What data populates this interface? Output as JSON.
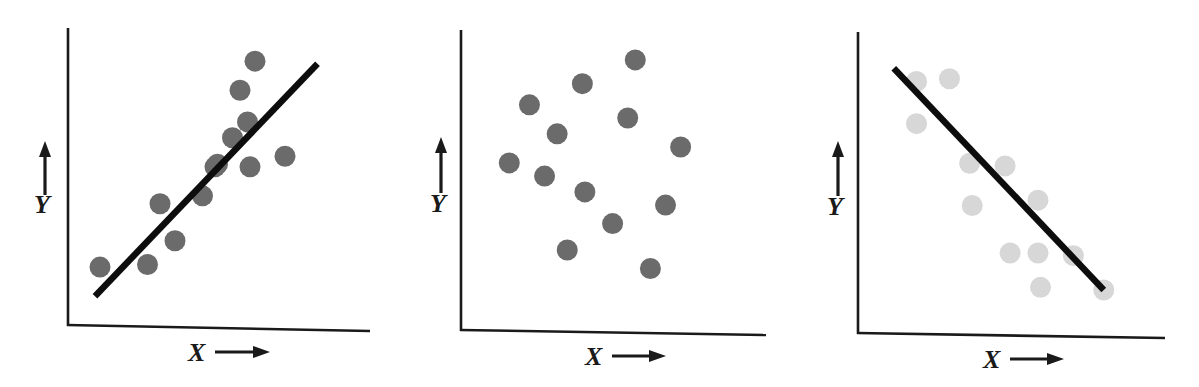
{
  "figure": {
    "background": "#ffffff",
    "width": 1199,
    "height": 387,
    "panel_count": 3
  },
  "style": {
    "axis_color": "#1a1a1a",
    "axis_width": 2.6,
    "trend_line_color": "#0d0d0d",
    "trend_line_width": 6.5,
    "dot_dark": "#6b6b6b",
    "dot_light": "#d7d7d7",
    "dot_radius": 10.5,
    "label_color": "#1a1a1a"
  },
  "chart_data": [
    {
      "type": "scatter",
      "title": "",
      "subtitle": "",
      "relationship": "positive correlation",
      "xlabel": "X",
      "ylabel": "Y",
      "xlabel_arrow": "right-arrow",
      "ylabel_arrow": "up-arrow",
      "grid": false,
      "legend": "none",
      "xlim": [
        0,
        100
      ],
      "ylim": [
        0,
        100
      ],
      "dot_color": "#6b6b6b",
      "has_trend_line": true,
      "trend_line": {
        "x": [
          6,
          95
        ],
        "y": [
          6,
          94
        ]
      },
      "points": [
        {
          "x": 8,
          "y": 17
        },
        {
          "x": 27,
          "y": 18
        },
        {
          "x": 38,
          "y": 27
        },
        {
          "x": 32,
          "y": 41
        },
        {
          "x": 49,
          "y": 44
        },
        {
          "x": 54,
          "y": 55
        },
        {
          "x": 55,
          "y": 56
        },
        {
          "x": 61,
          "y": 66
        },
        {
          "x": 67,
          "y": 72
        },
        {
          "x": 68,
          "y": 55
        },
        {
          "x": 64,
          "y": 84
        },
        {
          "x": 70,
          "y": 95
        },
        {
          "x": 82,
          "y": 59
        }
      ]
    },
    {
      "type": "scatter",
      "title": "",
      "subtitle": "",
      "relationship": "no correlation",
      "xlabel": "X",
      "ylabel": "Y",
      "xlabel_arrow": "right-arrow",
      "ylabel_arrow": "up-arrow",
      "grid": false,
      "legend": "none",
      "xlim": [
        0,
        100
      ],
      "ylim": [
        0,
        100
      ],
      "dot_color": "#6b6b6b",
      "has_trend_line": false,
      "points": [
        {
          "x": 14,
          "y": 58
        },
        {
          "x": 22,
          "y": 80
        },
        {
          "x": 28,
          "y": 53
        },
        {
          "x": 37,
          "y": 25
        },
        {
          "x": 33,
          "y": 69
        },
        {
          "x": 43,
          "y": 88
        },
        {
          "x": 44,
          "y": 47
        },
        {
          "x": 55,
          "y": 35
        },
        {
          "x": 61,
          "y": 75
        },
        {
          "x": 64,
          "y": 97
        },
        {
          "x": 70,
          "y": 18
        },
        {
          "x": 76,
          "y": 42
        },
        {
          "x": 82,
          "y": 64
        }
      ]
    },
    {
      "type": "scatter",
      "title": "",
      "subtitle": "",
      "relationship": "negative correlation",
      "xlabel": "X",
      "ylabel": "Y",
      "xlabel_arrow": "right-arrow",
      "ylabel_arrow": "up-arrow",
      "grid": false,
      "legend": "none",
      "xlim": [
        0,
        100
      ],
      "ylim": [
        0,
        100
      ],
      "dot_color": "#d7d7d7",
      "has_trend_line": true,
      "trend_line": {
        "x": [
          9,
          92
        ],
        "y": [
          95,
          11
        ]
      },
      "points": [
        {
          "x": 18,
          "y": 90
        },
        {
          "x": 31,
          "y": 91
        },
        {
          "x": 18,
          "y": 74
        },
        {
          "x": 39,
          "y": 59
        },
        {
          "x": 53,
          "y": 58
        },
        {
          "x": 40,
          "y": 43
        },
        {
          "x": 66,
          "y": 45
        },
        {
          "x": 55,
          "y": 25
        },
        {
          "x": 66,
          "y": 25
        },
        {
          "x": 80,
          "y": 24
        },
        {
          "x": 67,
          "y": 12
        },
        {
          "x": 92,
          "y": 11
        }
      ]
    }
  ]
}
